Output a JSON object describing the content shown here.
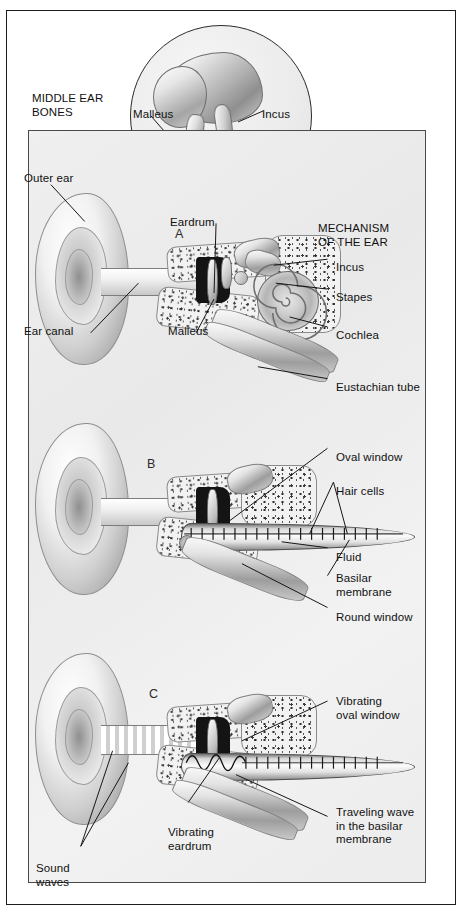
{
  "figure": {
    "inset_title": "MIDDLE EAR\nBONES",
    "main_title": "MECHANISM\nOF THE EAR"
  },
  "inset": {
    "name": "middle-ear-bones-inset",
    "labels": [
      {
        "id": "malleus",
        "text": "Malleus"
      },
      {
        "id": "incus",
        "text": "Incus"
      },
      {
        "id": "stapes",
        "text": "Stapes"
      }
    ]
  },
  "panels": [
    {
      "letter": "A",
      "name": "panel-a-anatomy",
      "labels": [
        {
          "id": "outer-ear",
          "text": "Outer ear"
        },
        {
          "id": "ear-canal",
          "text": "Ear canal"
        },
        {
          "id": "eardrum",
          "text": "Eardrum"
        },
        {
          "id": "malleus",
          "text": "Malleus"
        },
        {
          "id": "incus",
          "text": "Incus"
        },
        {
          "id": "stapes",
          "text": "Stapes"
        },
        {
          "id": "cochlea",
          "text": "Cochlea"
        },
        {
          "id": "eustachian-tube",
          "text": "Eustachian tube"
        }
      ]
    },
    {
      "letter": "B",
      "name": "panel-b-uncoiled-cochlea",
      "labels": [
        {
          "id": "oval-window",
          "text": "Oval window"
        },
        {
          "id": "hair-cells",
          "text": "Hair cells"
        },
        {
          "id": "fluid",
          "text": "Fluid"
        },
        {
          "id": "basilar-membrane",
          "text": "Basilar\nmembrane"
        },
        {
          "id": "round-window",
          "text": "Round window"
        }
      ]
    },
    {
      "letter": "C",
      "name": "panel-c-traveling-wave",
      "labels": [
        {
          "id": "vibrating-oval-window",
          "text": "Vibrating\noval window"
        },
        {
          "id": "traveling-wave",
          "text": "Traveling wave\nin the basilar\nmembrane"
        },
        {
          "id": "vibrating-eardrum",
          "text": "Vibrating\neardrum"
        },
        {
          "id": "sound-waves",
          "text": "Sound\nwaves"
        }
      ]
    }
  ],
  "colors": {
    "frame": "#1c1c1c",
    "panel_border": "#4a4a4a",
    "background": "#ffffff",
    "panel_background": "#eeeeee",
    "text": "#111111",
    "leader_line": "#1a1a1a"
  }
}
